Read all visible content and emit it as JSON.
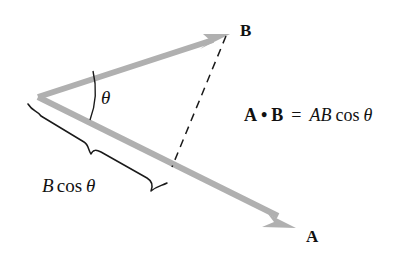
{
  "figure": {
    "background_color": "#ffffff",
    "vector_color": "#b0b0b0",
    "line_color": "#111111",
    "width": 418,
    "height": 258
  },
  "labels": {
    "vector_b": "B",
    "vector_a": "A",
    "angle_theta": "θ",
    "projection": {
      "magnitude": "B",
      "function": "cos",
      "angle": "θ"
    }
  },
  "equation": {
    "lhs_a": "A",
    "dot_operator": "•",
    "lhs_b": "B",
    "equals": "=",
    "rhs_magnitudes": "AB",
    "rhs_function": "cos",
    "rhs_angle": "θ"
  },
  "geometry": {
    "origin": {
      "x": 38,
      "y": 97
    },
    "vector_b_tip": {
      "x": 228,
      "y": 35
    },
    "vector_a_tip": {
      "x": 295,
      "y": 228
    },
    "projection_foot": {
      "x": 172,
      "y": 166
    },
    "arc_start": {
      "x": 92,
      "y": 72
    },
    "arc_end": {
      "x": 90,
      "y": 119
    }
  }
}
